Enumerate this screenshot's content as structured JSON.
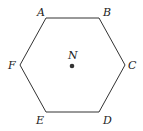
{
  "figure": {
    "shape": "regular-hexagon",
    "stroke_color": "#333333",
    "point_color": "#333333",
    "vertices": [
      {
        "label": "A",
        "x": 46,
        "y": 18,
        "lx": 37,
        "ly": 16
      },
      {
        "label": "B",
        "x": 99,
        "y": 18,
        "lx": 103,
        "ly": 16
      },
      {
        "label": "C",
        "x": 125,
        "y": 65,
        "lx": 128,
        "ly": 69
      },
      {
        "label": "D",
        "x": 99,
        "y": 112,
        "lx": 103,
        "ly": 124
      },
      {
        "label": "E",
        "x": 46,
        "y": 112,
        "lx": 36,
        "ly": 124
      },
      {
        "label": "F",
        "x": 20,
        "y": 65,
        "lx": 8,
        "ly": 69
      }
    ],
    "center": {
      "label": "N",
      "x": 72,
      "y": 66,
      "lx": 68,
      "ly": 59
    }
  },
  "cutoff_text": "g g"
}
